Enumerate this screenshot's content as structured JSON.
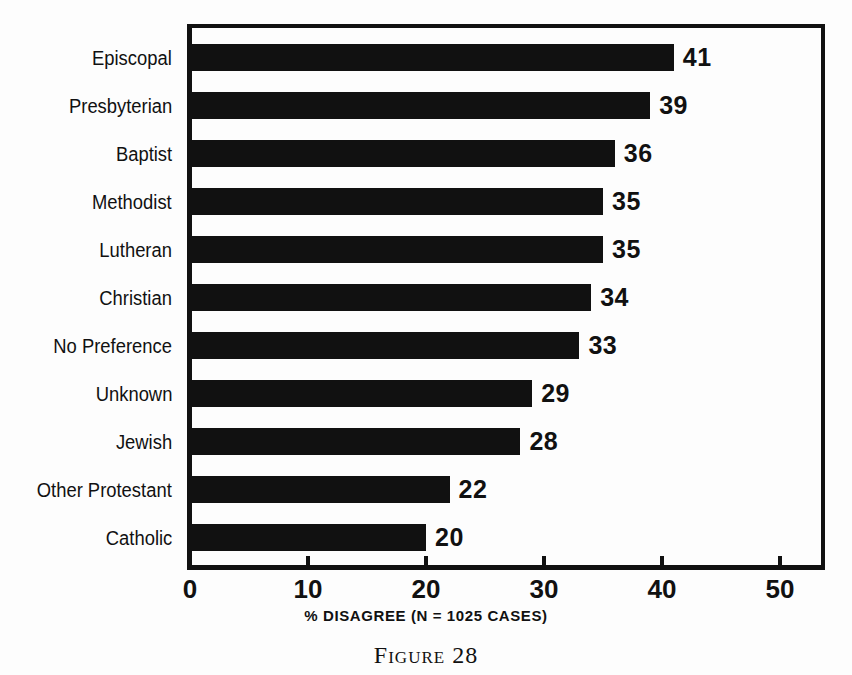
{
  "figure": {
    "caption": "Figure 28",
    "background_color": "#fdfdfd",
    "bar_color": "#111111",
    "axis_color": "#111111"
  },
  "chart_data": {
    "type": "bar",
    "orientation": "horizontal",
    "title": "",
    "xlabel": "% DISAGREE (N = 1025 CASES)",
    "ylabel": "",
    "xlim": [
      0,
      54
    ],
    "xticks": [
      0,
      10,
      20,
      30,
      40,
      50
    ],
    "xtick_labels": [
      "0",
      "10",
      "20",
      "30",
      "40",
      "50"
    ],
    "grid": false,
    "legend": false,
    "categories": [
      "Episcopal",
      "Presbyterian",
      "Baptist",
      "Methodist",
      "Lutheran",
      "Christian",
      "No Preference",
      "Unknown",
      "Jewish",
      "Other Protestant",
      "Catholic"
    ],
    "values": [
      41,
      39,
      36,
      35,
      35,
      34,
      33,
      29,
      28,
      22,
      20
    ],
    "value_labels": [
      "41",
      "39",
      "36",
      "35",
      "35",
      "34",
      "33",
      "29",
      "28",
      "22",
      "20"
    ],
    "n_cases": 1025
  }
}
